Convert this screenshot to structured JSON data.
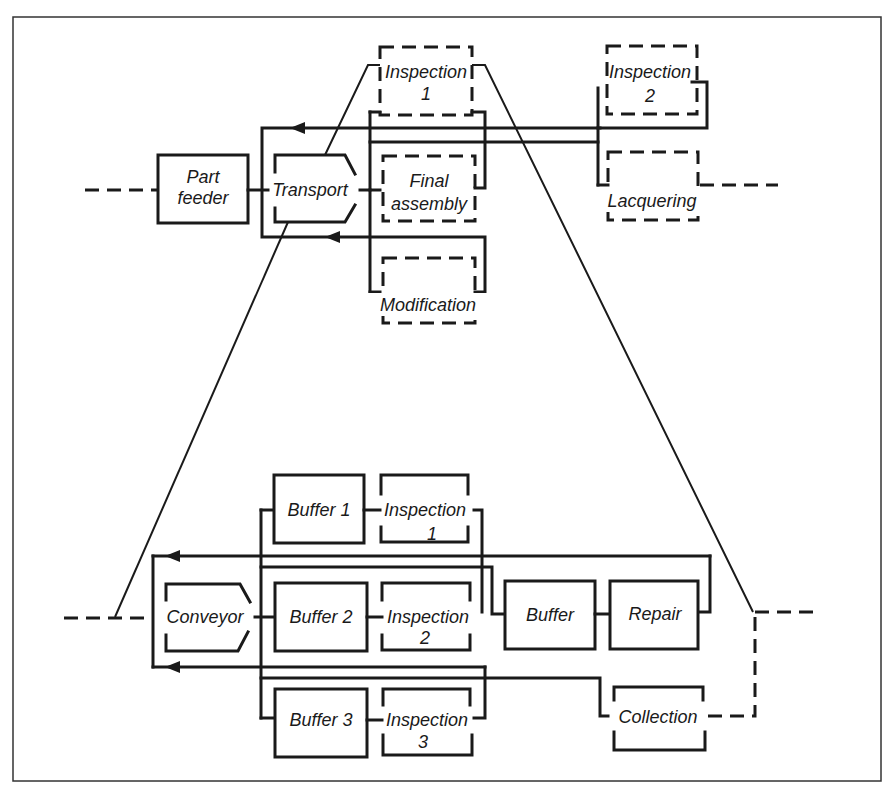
{
  "diagram": {
    "colors": {
      "line": "#1a1a1a",
      "background": "#ffffff",
      "frame": "#333333"
    },
    "upper": {
      "part_feeder": [
        "Part",
        "feeder"
      ],
      "transport": "Transport",
      "inspection1": [
        "Inspection",
        "1"
      ],
      "final_assembly": [
        "Final",
        "assembly"
      ],
      "modification": "Modification",
      "inspection2": [
        "Inspection",
        "2"
      ],
      "lacquering": "Lacquering"
    },
    "lower": {
      "conveyor": "Conveyor",
      "buffer1": "Buffer 1",
      "buffer2": "Buffer 2",
      "buffer3": "Buffer 3",
      "inspection1": [
        "Inspection",
        "1"
      ],
      "inspection2": [
        "Inspection",
        "2"
      ],
      "inspection3": [
        "Inspection",
        "3"
      ],
      "buffer": "Buffer",
      "repair": "Repair",
      "collection": "Collection"
    }
  }
}
